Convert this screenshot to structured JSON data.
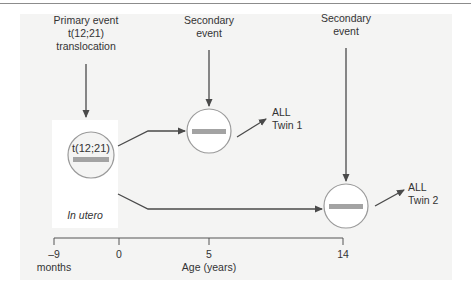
{
  "events": {
    "primary": {
      "line1": "Primary event",
      "line2": "t(12;21)",
      "line3": "translocation"
    },
    "secondary_1": {
      "line1": "Secondary",
      "line2": "event"
    },
    "secondary_2": {
      "line1": "Secondary",
      "line2": "event"
    }
  },
  "cells": {
    "origin": {
      "label": "t(12;21)",
      "context": "In utero"
    },
    "twin1": {
      "label": ""
    },
    "twin2": {
      "label": ""
    }
  },
  "outcomes": {
    "twin1": {
      "line1": "ALL",
      "line2": "Twin 1"
    },
    "twin2": {
      "line1": "ALL",
      "line2": "Twin 2"
    }
  },
  "axis": {
    "ticks": [
      {
        "value": "–9",
        "x": 54
      },
      {
        "value": "0",
        "x": 119
      },
      {
        "value": "5",
        "x": 209
      },
      {
        "value": "14",
        "x": 343
      }
    ],
    "unit_prenatal": "months",
    "label": "Age (years)"
  },
  "colors": {
    "panel_bg": "#f4f4f3",
    "line": "#4a4a4a",
    "circle_stroke": "#9a9a9a",
    "chromosome_bar": "#a3a3a3"
  }
}
